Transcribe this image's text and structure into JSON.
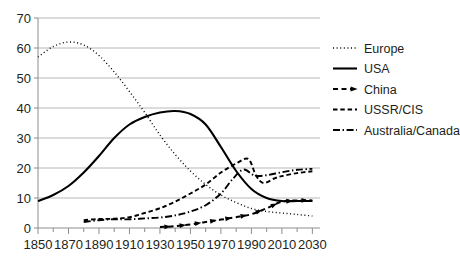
{
  "chart_data": {
    "type": "line",
    "title": "",
    "subtitle": "",
    "xlabel": "",
    "ylabel": "",
    "xlim": [
      1850,
      2035
    ],
    "ylim": [
      0,
      70
    ],
    "grid": "horizontal",
    "legend_position": "right",
    "background_color": "#ffffff",
    "line_color": "#000000",
    "gridline_color": "#b8b8b8",
    "y_ticks": [
      0,
      10,
      20,
      30,
      40,
      50,
      60,
      70
    ],
    "y_tick_labels": [
      "0",
      "10",
      "20",
      "30",
      "40",
      "50",
      "60",
      "70"
    ],
    "x_ticks": [
      1850,
      1870,
      1890,
      1910,
      1930,
      1950,
      1970,
      1990,
      2010,
      2030
    ],
    "x_tick_labels": [
      "1850",
      "1870",
      "1890",
      "1910",
      "1930",
      "1950",
      "1970",
      "1990",
      "2010",
      "2030"
    ],
    "x_minor_ticks": [
      1860,
      1880,
      1900,
      1920,
      1940,
      1960,
      1980,
      2000,
      2020
    ],
    "series": [
      {
        "name": "Europe",
        "style": "dotted",
        "dash": "1,2.6",
        "width": 1.4,
        "marker": "none",
        "x": [
          1850,
          1860,
          1870,
          1880,
          1890,
          1900,
          1910,
          1920,
          1930,
          1940,
          1950,
          1960,
          1970,
          1980,
          1990,
          2000,
          2010,
          2020,
          2030
        ],
        "values": [
          57,
          60.5,
          62,
          61,
          57.5,
          52,
          45.5,
          38.5,
          31,
          24.5,
          19,
          14.5,
          11,
          8.5,
          6.5,
          5.5,
          5,
          4.5,
          4
        ]
      },
      {
        "name": "USA",
        "style": "solid",
        "dash": "none",
        "width": 2.1,
        "marker": "none",
        "x": [
          1850,
          1860,
          1870,
          1880,
          1890,
          1900,
          1910,
          1920,
          1930,
          1940,
          1950,
          1960,
          1970,
          1980,
          1990,
          2000,
          2010,
          2020,
          2030
        ],
        "values": [
          9,
          11,
          14,
          18.5,
          24,
          30,
          34.5,
          37,
          38.5,
          39,
          38,
          34.5,
          27,
          19,
          13,
          10,
          9,
          9,
          9
        ]
      },
      {
        "name": "China",
        "style": "dashed-marker",
        "dash": "5,3.5",
        "width": 2.0,
        "marker": "arrow",
        "x": [
          1930,
          1940,
          1950,
          1960,
          1970,
          1980,
          1990,
          2000,
          2010,
          2020,
          2030
        ],
        "values": [
          0.3,
          0.6,
          1.2,
          2.0,
          2.8,
          3.6,
          4.6,
          6.6,
          8.8,
          9.2,
          9.2
        ]
      },
      {
        "name": "USSR/CIS",
        "style": "dashed",
        "dash": "4.5,2.8",
        "width": 1.9,
        "marker": "none",
        "x": [
          1880,
          1890,
          1900,
          1910,
          1920,
          1930,
          1940,
          1950,
          1960,
          1970,
          1980,
          1988,
          1993,
          1998,
          2005,
          2010,
          2020,
          2030
        ],
        "values": [
          2.6,
          3.0,
          3.1,
          3.6,
          5.0,
          6.6,
          8.8,
          11.5,
          14.5,
          18.5,
          21.5,
          23,
          17.5,
          15,
          16.5,
          17.3,
          18.3,
          18.9
        ]
      },
      {
        "name": "Australia/Canada",
        "style": "dash-dot",
        "dash": "7,2.6,1.4,2.6",
        "width": 1.9,
        "marker": "none",
        "x": [
          1880,
          1890,
          1900,
          1910,
          1920,
          1930,
          1940,
          1950,
          1960,
          1970,
          1978,
          1985,
          1992,
          2000,
          2010,
          2020,
          2030
        ],
        "values": [
          2.0,
          2.6,
          2.9,
          2.9,
          3.2,
          3.5,
          4.2,
          5.5,
          7.6,
          11.5,
          16.5,
          19.5,
          17.5,
          17.6,
          18.6,
          19.4,
          19.7
        ]
      }
    ],
    "legend_entries": [
      {
        "label": "Europe",
        "style": "dotted"
      },
      {
        "label": "USA",
        "style": "solid"
      },
      {
        "label": "China",
        "style": "dashed-marker"
      },
      {
        "label": "USSR/CIS",
        "style": "dashed"
      },
      {
        "label": "Australia/Canada",
        "style": "dash-dot"
      }
    ]
  }
}
